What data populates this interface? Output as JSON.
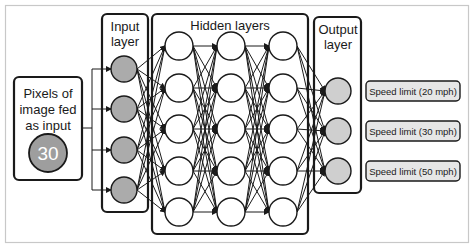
{
  "diagram": {
    "input_source": {
      "label_lines": [
        "Pixels of",
        "image fed",
        "as input"
      ],
      "sample_value": "30"
    },
    "layers": {
      "input": {
        "label_lines": [
          "Input",
          "layer"
        ],
        "node_count": 4
      },
      "hidden": {
        "label": "Hidden layers",
        "layer_count": 3,
        "nodes_per_layer": 5
      },
      "output": {
        "label_lines": [
          "Output",
          "layer"
        ],
        "node_count": 3
      }
    },
    "outputs": [
      "Speed limit (20 mph)",
      "Speed limit (30 mph)",
      "Speed limit (50 mph)"
    ],
    "colors": {
      "stroke": "#1a1a1a",
      "input_node_fill": "#ababab",
      "sample_circle_fill": "#9e9e9e",
      "sample_text": "#ffffff",
      "hidden_node_fill": "#ffffff",
      "output_node_fill": "#cfcfcf",
      "output_label_fill": "#e6e6e6",
      "frame": "#c8c8c8"
    }
  }
}
